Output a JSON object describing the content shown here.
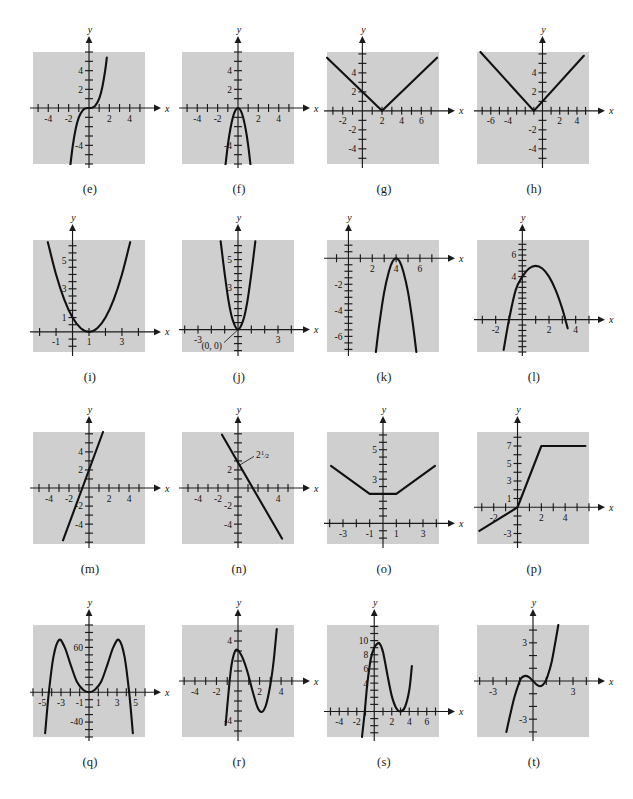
{
  "page": {
    "type": "textbook-figure-grid",
    "background_color": "#ffffff",
    "plate_color": "#cfcfcf",
    "curve_color": "#111111",
    "columns": 4,
    "rows": 4
  },
  "panels": [
    {
      "id": "e",
      "caption": "(e)",
      "x_axis_label": "x",
      "y_axis_label": "y",
      "x_ticks": [
        "-4",
        "-2",
        "2",
        "4"
      ],
      "y_ticks": [
        "2",
        "4",
        "-4"
      ],
      "annotations": [],
      "chart_data": {
        "type": "line",
        "title": "(e)",
        "xlabel": "x",
        "ylabel": "y",
        "xlim": [
          -5.5,
          5.5
        ],
        "ylim": [
          -6,
          6
        ],
        "grid": false,
        "series": [
          {
            "name": "cubic",
            "description": "cubic through origin, steeply rising",
            "x": [
              -1.85,
              -1.6,
              -1.3,
              -1.0,
              -0.6,
              -0.3,
              0,
              0.3,
              0.6,
              1.0,
              1.3,
              1.6,
              1.75
            ],
            "y": [
              -6.3,
              -4.1,
              -2.2,
              -1.0,
              -0.22,
              -0.03,
              0,
              0.03,
              0.22,
              1.0,
              2.2,
              4.1,
              5.4
            ]
          }
        ]
      }
    },
    {
      "id": "f",
      "caption": "(f)",
      "x_axis_label": "x",
      "y_axis_label": "y",
      "x_ticks": [
        "-4",
        "-2",
        "2",
        "4"
      ],
      "y_ticks": [
        "2",
        "4",
        "-4"
      ],
      "annotations": [],
      "chart_data": {
        "type": "line",
        "title": "(f)",
        "xlabel": "x",
        "ylabel": "y",
        "xlim": [
          -5.5,
          5.5
        ],
        "ylim": [
          -6,
          6
        ],
        "grid": false,
        "series": [
          {
            "name": "downward-narrow-parabola",
            "description": "downward opening narrow parabola, vertex near (0,0)",
            "x": [
              -1.25,
              -1.0,
              -0.75,
              -0.5,
              -0.25,
              0,
              0.25,
              0.5,
              0.75,
              1.0,
              1.25
            ],
            "y": [
              -6.3,
              -4.0,
              -2.25,
              -1.0,
              -0.25,
              0,
              -0.25,
              -1.0,
              -2.25,
              -4.0,
              -6.3
            ]
          }
        ]
      }
    },
    {
      "id": "g",
      "caption": "(g)",
      "x_axis_label": "x",
      "y_axis_label": "y",
      "x_ticks": [
        "-2",
        "2",
        "4",
        "6"
      ],
      "y_ticks": [
        "2",
        "4",
        "-2",
        "-4"
      ],
      "annotations": [],
      "chart_data": {
        "type": "line",
        "title": "(g)",
        "xlabel": "x",
        "ylabel": "y",
        "xlim": [
          -3.6,
          7.8
        ],
        "ylim": [
          -5.6,
          6.2
        ],
        "grid": false,
        "series": [
          {
            "name": "absolute-value-shifted-right-2",
            "description": "V shape with vertex at (2,0), slope 1",
            "x": [
              -3.6,
              2,
              7.6
            ],
            "y": [
              5.6,
              0,
              5.6
            ]
          }
        ]
      }
    },
    {
      "id": "h",
      "caption": "(h)",
      "x_axis_label": "x",
      "y_axis_label": "y",
      "x_ticks": [
        "-6",
        "-4",
        "2",
        "4"
      ],
      "y_ticks": [
        "2",
        "4",
        "-2",
        "-4"
      ],
      "annotations": [],
      "chart_data": {
        "type": "line",
        "title": "(h)",
        "xlabel": "x",
        "ylabel": "y",
        "xlim": [
          -7.6,
          5.4
        ],
        "ylim": [
          -5.6,
          6.2
        ],
        "grid": false,
        "series": [
          {
            "name": "absolute-value-shifted-left-1",
            "description": "V shape with vertex at (-1,0), slope 1",
            "x": [
              -7.2,
              -1,
              4.8
            ],
            "y": [
              6.2,
              0,
              5.8
            ]
          }
        ]
      }
    },
    {
      "id": "i",
      "caption": "(i)",
      "x_axis_label": "x",
      "y_axis_label": "y",
      "x_ticks": [
        "-1",
        "1",
        "3"
      ],
      "y_ticks": [
        "1",
        "3",
        "5"
      ],
      "annotations": [],
      "chart_data": {
        "type": "line",
        "title": "(i)",
        "xlabel": "x",
        "ylabel": "y",
        "xlim": [
          -2.4,
          4.4
        ],
        "ylim": [
          -1.4,
          6.4
        ],
        "grid": false,
        "series": [
          {
            "name": "parabola-vertex-1-0",
            "description": "upward parabola, vertex (1,0), y-intercept 1",
            "x": [
              -1.5,
              -1.0,
              -0.5,
              0,
              0.5,
              1.0,
              1.5,
              2.0,
              2.5,
              3.0,
              3.5
            ],
            "y": [
              6.25,
              4.0,
              2.25,
              1.0,
              0.25,
              0,
              0.25,
              1.0,
              2.25,
              4.0,
              6.25
            ]
          }
        ]
      }
    },
    {
      "id": "j",
      "caption": "(j)",
      "x_axis_label": "x",
      "y_axis_label": "y",
      "x_ticks": [
        "-3",
        "3"
      ],
      "y_ticks": [
        "3",
        "5"
      ],
      "annotations": [
        "(0, 0)"
      ],
      "chart_data": {
        "type": "line",
        "title": "(j)",
        "xlabel": "x",
        "ylabel": "y",
        "xlim": [
          -4.2,
          4.2
        ],
        "ylim": [
          -1.6,
          6.4
        ],
        "grid": false,
        "annotation_points": [
          {
            "label": "(0, 0)",
            "x": 0,
            "y": 0
          }
        ],
        "series": [
          {
            "name": "parabola-vertex-origin",
            "description": "upward narrow parabola with vertex at origin",
            "x": [
              -1.3,
              -1.0,
              -0.7,
              -0.4,
              0,
              0.4,
              0.7,
              1.0,
              1.3
            ],
            "y": [
              6.3,
              4.0,
              2.0,
              0.7,
              0,
              0.7,
              2.0,
              4.0,
              6.3
            ]
          }
        ]
      }
    },
    {
      "id": "k",
      "caption": "(k)",
      "x_axis_label": "x",
      "y_axis_label": "y",
      "x_ticks": [
        "2",
        "4",
        "6"
      ],
      "y_ticks": [
        "-2",
        "-4",
        "-6"
      ],
      "annotations": [],
      "chart_data": {
        "type": "line",
        "title": "(k)",
        "xlabel": "x",
        "ylabel": "y",
        "xlim": [
          -1.8,
          7.6
        ],
        "ylim": [
          -7.2,
          1.4
        ],
        "grid": false,
        "series": [
          {
            "name": "downward-parabola-vertex-4-0",
            "description": "downward parabola with vertex at (4,0)",
            "x": [
              2.3,
              2.6,
              3.0,
              3.4,
              3.7,
              4.0,
              4.3,
              4.6,
              5.0,
              5.4,
              5.7
            ],
            "y": [
              -7.2,
              -5.0,
              -2.6,
              -1.0,
              -0.25,
              0,
              -0.25,
              -1.0,
              -2.6,
              -5.0,
              -7.2
            ]
          }
        ]
      }
    },
    {
      "id": "l",
      "caption": "(l)",
      "x_axis_label": "x",
      "y_axis_label": "y",
      "x_ticks": [
        "-2",
        "2",
        "4"
      ],
      "y_ticks": [
        "4",
        "6"
      ],
      "annotations": [],
      "chart_data": {
        "type": "line",
        "title": "(l)",
        "xlabel": "x",
        "ylabel": "y",
        "xlim": [
          -3.4,
          5.0
        ],
        "ylim": [
          -3.0,
          7.4
        ],
        "grid": false,
        "series": [
          {
            "name": "downward-parabola-vertex-1-5",
            "description": "downward parabola, vertex near (1,5), y-intercept 4",
            "x": [
              -1.4,
              -1.0,
              -0.5,
              0,
              0.5,
              1.0,
              1.5,
              2.0,
              2.5,
              3.0,
              3.4
            ],
            "y": [
              -2.8,
              0.0,
              2.75,
              4.0,
              4.75,
              5.0,
              4.75,
              4.0,
              2.75,
              1.0,
              -0.8
            ]
          }
        ]
      }
    },
    {
      "id": "m",
      "caption": "(m)",
      "x_axis_label": "x",
      "y_axis_label": "y",
      "x_ticks": [
        "-4",
        "-2",
        "2",
        "4"
      ],
      "y_ticks": [
        "2",
        "4",
        "-2",
        "-4"
      ],
      "annotations": [],
      "chart_data": {
        "type": "line",
        "title": "(m)",
        "xlabel": "x",
        "ylabel": "y",
        "xlim": [
          -5.6,
          5.6
        ],
        "ylim": [
          -6.2,
          6.2
        ],
        "grid": false,
        "series": [
          {
            "name": "steep-increasing-line",
            "description": "steep line, y-intercept about 2, positive slope ~3",
            "x": [
              -2.6,
              1.4
            ],
            "y": [
              -5.8,
              6.2
            ]
          }
        ]
      }
    },
    {
      "id": "n",
      "caption": "(n)",
      "x_axis_label": "x",
      "y_axis_label": "y",
      "x_ticks": [
        "-4",
        "-2",
        "4"
      ],
      "y_ticks": [
        "2",
        "-2",
        "-4"
      ],
      "annotations": [
        "2½"
      ],
      "chart_data": {
        "type": "line",
        "title": "(n)",
        "xlabel": "x",
        "ylabel": "y",
        "xlim": [
          -5.6,
          5.6
        ],
        "ylim": [
          -6.2,
          6.2
        ],
        "grid": false,
        "annotation_points": [
          {
            "label": "2½",
            "x": 0,
            "y": 2.5
          }
        ],
        "series": [
          {
            "name": "decreasing-line",
            "description": "line with y-intercept 2½ and negative slope ~-1.6",
            "x": [
              -1.6,
              4.4
            ],
            "y": [
              5.9,
              -5.6
            ]
          }
        ]
      }
    },
    {
      "id": "o",
      "caption": "(o)",
      "x_axis_label": "x",
      "y_axis_label": "y",
      "x_ticks": [
        "-3",
        "-1",
        "1",
        "3"
      ],
      "y_ticks": [
        "3",
        "5"
      ],
      "annotations": [],
      "chart_data": {
        "type": "line",
        "title": "(o)",
        "xlabel": "x",
        "ylabel": "y",
        "xlim": [
          -4.2,
          4.2
        ],
        "ylim": [
          -1.4,
          6.2
        ],
        "grid": false,
        "series": [
          {
            "name": "flat-bottomed-piecewise",
            "description": "piecewise: decreasing to y=2 on [-3.9,-1], flat y=2 on [-1,1], increasing after 1",
            "x": [
              -3.9,
              -1,
              1,
              3.9
            ],
            "y": [
              3.9,
              2,
              2,
              3.9
            ]
          }
        ]
      }
    },
    {
      "id": "p",
      "caption": "(p)",
      "x_axis_label": "x",
      "y_axis_label": "y",
      "x_ticks": [
        "-2",
        "2",
        "4"
      ],
      "y_ticks": [
        "1",
        "3",
        "5",
        "7",
        "-3"
      ],
      "annotations": [],
      "chart_data": {
        "type": "line",
        "title": "(p)",
        "xlabel": "x",
        "ylabel": "y",
        "xlim": [
          -3.4,
          6.0
        ],
        "ylim": [
          -4.2,
          8.6
        ],
        "grid": false,
        "series": [
          {
            "name": "piecewise-ramp-to-plateau",
            "description": "shallow line then steep ramp through origin to plateau y=7 from x=2",
            "x": [
              -3.2,
              0,
              2,
              5.7
            ],
            "y": [
              -2.7,
              0,
              7,
              7
            ]
          }
        ]
      }
    },
    {
      "id": "q",
      "caption": "(q)",
      "x_axis_label": "x",
      "y_axis_label": "y",
      "x_ticks": [
        "-5",
        "-3",
        "-1",
        "1",
        "3",
        "5"
      ],
      "y_ticks": [
        "60",
        "-40"
      ],
      "annotations": [],
      "chart_data": {
        "type": "line",
        "title": "(q)",
        "xlabel": "x",
        "ylabel": "y",
        "xlim": [
          -6.0,
          6.0
        ],
        "ylim": [
          -60,
          90
        ],
        "grid": false,
        "series": [
          {
            "name": "quartic-W-shape",
            "description": "negative-leading quartic: two maxima near x=±3 at ~70, local min at origin y=0, roots near ±4.3",
            "x": [
              -4.7,
              -4.3,
              -3.8,
              -3.2,
              -2.6,
              -2.0,
              -1.3,
              -0.6,
              0,
              0.6,
              1.3,
              2.0,
              2.6,
              3.2,
              3.8,
              4.3,
              4.7
            ],
            "y": [
              -55,
              0,
              48,
              70,
              60,
              38,
              14,
              3,
              0,
              3,
              14,
              38,
              60,
              70,
              48,
              0,
              -55
            ]
          }
        ]
      }
    },
    {
      "id": "r",
      "caption": "(r)",
      "x_axis_label": "x",
      "y_axis_label": "y",
      "x_ticks": [
        "-4",
        "-2",
        "2",
        "4"
      ],
      "y_ticks": [
        "4",
        "-4"
      ],
      "annotations": [],
      "chart_data": {
        "type": "line",
        "title": "(r)",
        "xlabel": "x",
        "ylabel": "y",
        "xlim": [
          -5.2,
          5.2
        ],
        "ylim": [
          -5.6,
          5.6
        ],
        "grid": false,
        "series": [
          {
            "name": "cubic-local-max-min",
            "description": "cubic with local max ~3 near x=-0.2 and local min ~-3 near x=2.2",
            "x": [
              -1.15,
              -0.9,
              -0.6,
              -0.2,
              0.3,
              0.8,
              1.3,
              1.8,
              2.2,
              2.6,
              3.0,
              3.3,
              3.6
            ],
            "y": [
              -4.4,
              -1.4,
              1.6,
              3.1,
              2.6,
              1.2,
              -0.8,
              -2.6,
              -3.1,
              -2.4,
              -0.4,
              1.9,
              5.2
            ]
          }
        ]
      }
    },
    {
      "id": "s",
      "caption": "(s)",
      "x_axis_label": "x",
      "y_axis_label": "y",
      "x_ticks": [
        "-4",
        "-2",
        "2",
        "4",
        "6"
      ],
      "y_ticks": [
        "4",
        "6",
        "8",
        "10"
      ],
      "annotations": [],
      "chart_data": {
        "type": "line",
        "title": "(s)",
        "xlabel": "x",
        "ylabel": "y",
        "xlim": [
          -5.4,
          7.4
        ],
        "ylim": [
          -3.6,
          12.2
        ],
        "grid": false,
        "series": [
          {
            "name": "cubic-max-near-0.6",
            "description": "cubic with local max ~9.6 near x=0.6, local min 0 at x=3 (double root)",
            "x": [
              -1.4,
              -1.1,
              -0.8,
              -0.4,
              0,
              0.3,
              0.6,
              1.0,
              1.5,
              2.0,
              2.5,
              3.0,
              3.5,
              4.0,
              4.3
            ],
            "y": [
              -3.6,
              -0.2,
              3.8,
              7.4,
              9.0,
              9.5,
              9.6,
              8.4,
              5.2,
              2.2,
              0.5,
              0,
              0.6,
              3.0,
              6.4
            ]
          }
        ]
      }
    },
    {
      "id": "t",
      "caption": "(t)",
      "x_axis_label": "x",
      "y_axis_label": "y",
      "x_ticks": [
        "-3",
        "3"
      ],
      "y_ticks": [
        "3",
        "-3"
      ],
      "annotations": [],
      "chart_data": {
        "type": "line",
        "title": "(t)",
        "xlabel": "x",
        "ylabel": "y",
        "xlim": [
          -4.2,
          4.2
        ],
        "ylim": [
          -4.4,
          4.4
        ],
        "grid": false,
        "series": [
          {
            "name": "cubic-gentle-wiggle",
            "description": "cubic with shallow local max ~0.4 near x=-0.6 and local min ~-0.4 near x=0.6, rising steeply after x=1",
            "x": [
              -2.0,
              -1.7,
              -1.4,
              -1.1,
              -0.9,
              -0.6,
              -0.3,
              0,
              0.3,
              0.6,
              0.9,
              1.1,
              1.4,
              1.7,
              1.9
            ],
            "y": [
              -4.0,
              -2.6,
              -1.3,
              -0.3,
              0.2,
              0.4,
              0.3,
              0,
              -0.3,
              -0.4,
              -0.1,
              0.4,
              1.5,
              3.2,
              4.4
            ]
          }
        ]
      }
    }
  ]
}
